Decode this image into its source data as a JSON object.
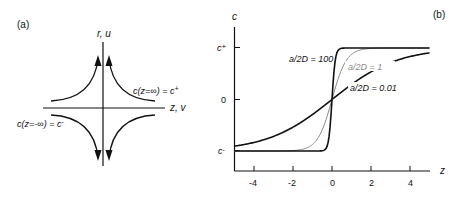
{
  "panel_a": {
    "label": "(a)",
    "vertical_axis_label": "r, u",
    "horizontal_axis_label": "z, v",
    "annotation_plus": "c(z=∞) = c",
    "annotation_plus_sup": "+",
    "annotation_minus": "c(z=-∞) = c",
    "annotation_minus_sup": "-"
  },
  "panel_b": {
    "label": "(b)",
    "ylabel": "c",
    "xlabel": "z",
    "y_ticks": [
      {
        "label": "c",
        "sup": "+",
        "value": 1
      },
      {
        "label": "0",
        "sup": "",
        "value": 0
      },
      {
        "label": "c",
        "sup": "-",
        "value": -1
      }
    ],
    "x_ticks": [
      "-4",
      "-2",
      "0",
      "2",
      "4"
    ],
    "curve_labels": {
      "c100": "a/2D = 100",
      "c1": "a/2D = 1",
      "c001": "a/2D = 0.01"
    }
  },
  "chart_data": {
    "type": "line",
    "title": "",
    "xlabel": "z",
    "ylabel": "c",
    "xlim": [
      -5,
      5
    ],
    "ylim": [
      "c-",
      "c+"
    ],
    "x_ticks": [
      -4,
      -2,
      0,
      2,
      4
    ],
    "y_ticks": [
      "c-",
      "0",
      "c+"
    ],
    "grid": false,
    "series": [
      {
        "name": "a/2D = 100",
        "color": "#111111",
        "x": [
          -5,
          -1,
          -0.5,
          -0.25,
          0,
          0.25,
          0.5,
          1,
          5
        ],
        "y": [
          -1,
          -1,
          -0.99,
          -0.9,
          0,
          0.9,
          0.99,
          1,
          1
        ]
      },
      {
        "name": "a/2D = 1",
        "color": "#888888",
        "x": [
          -5,
          -2,
          -1,
          -0.5,
          0,
          0.5,
          1,
          2,
          5
        ],
        "y": [
          -1,
          -0.99,
          -0.87,
          -0.58,
          0,
          0.58,
          0.87,
          0.99,
          1
        ]
      },
      {
        "name": "a/2D = 0.01",
        "color": "#111111",
        "x": [
          -5,
          -4,
          -2,
          -1,
          0,
          1,
          2,
          4,
          5
        ],
        "y": [
          -0.9,
          -0.83,
          -0.54,
          -0.29,
          0,
          0.29,
          0.54,
          0.83,
          0.9
        ]
      }
    ]
  }
}
